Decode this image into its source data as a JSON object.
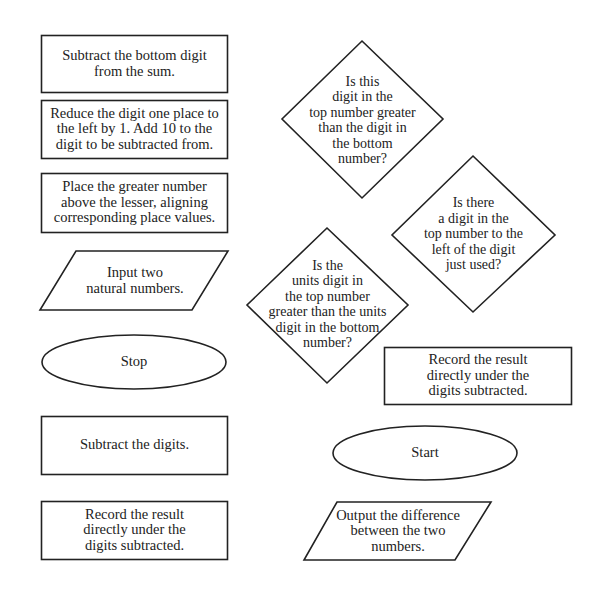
{
  "diagram": {
    "type": "flowchart-shapes-unordered",
    "colors": {
      "background": "#ffffff",
      "stroke": "#222222",
      "text": "#222222"
    },
    "shapes": {
      "process_subtract_bottom_from_sum": {
        "shape": "rectangle",
        "lines": [
          "Subtract the bottom digit",
          "from the sum."
        ]
      },
      "process_reduce_digit": {
        "shape": "rectangle",
        "lines": [
          "Reduce the digit one place to",
          "the left by 1. Add 10 to the",
          "digit to be subtracted from."
        ]
      },
      "process_place_greater": {
        "shape": "rectangle",
        "lines": [
          "Place the greater number",
          "above the lesser, aligning",
          "corresponding place values."
        ]
      },
      "io_input": {
        "shape": "parallelogram",
        "lines": [
          "Input two",
          "natural numbers."
        ]
      },
      "terminal_stop": {
        "shape": "ellipse",
        "lines": [
          "Stop"
        ]
      },
      "process_subtract_digits": {
        "shape": "rectangle",
        "lines": [
          "Subtract the digits."
        ]
      },
      "process_record_left": {
        "shape": "rectangle",
        "lines": [
          "Record the result",
          "directly under the",
          "digits  subtracted."
        ]
      },
      "decision_this_digit_greater": {
        "shape": "diamond",
        "lines": [
          "Is this",
          "digit in the",
          "top number greater",
          "than the digit in",
          "the bottom",
          "number?"
        ]
      },
      "decision_digit_to_left": {
        "shape": "diamond",
        "lines": [
          "Is there",
          "a digit in the",
          "top number to the",
          "left of the digit",
          "just used?"
        ]
      },
      "decision_units_digit_greater": {
        "shape": "diamond",
        "lines": [
          "Is the",
          "units digit in",
          "the top number",
          "greater than the units",
          "digit in the bottom",
          "number?"
        ]
      },
      "process_record_right": {
        "shape": "rectangle",
        "lines": [
          "Record the result",
          "directly under the",
          "digits  subtracted."
        ]
      },
      "terminal_start": {
        "shape": "ellipse",
        "lines": [
          "Start"
        ]
      },
      "io_output": {
        "shape": "parallelogram",
        "lines": [
          "Output the difference",
          "between the two",
          "numbers."
        ]
      }
    }
  }
}
